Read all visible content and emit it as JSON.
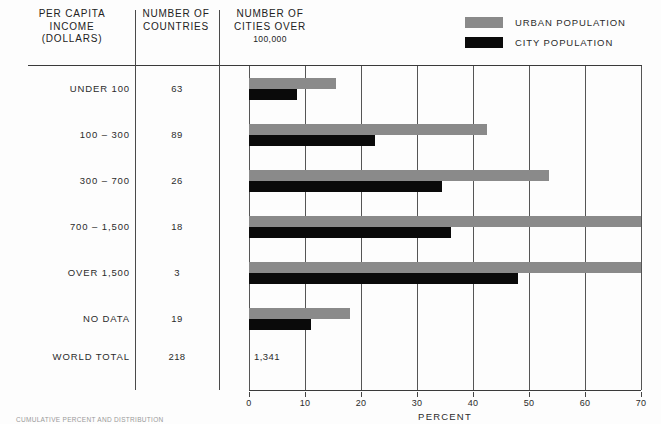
{
  "legend": {
    "items": [
      {
        "label": "URBAN POPULATION",
        "color": "#8a8a8a",
        "swatch": "urban-swatch"
      },
      {
        "label": "CITY POPULATION",
        "color": "#0a0a0a",
        "swatch": "city-swatch"
      }
    ]
  },
  "table": {
    "headers": {
      "income": {
        "line1": "PER CAPITA",
        "line2": "INCOME",
        "line3": "(DOLLARS)"
      },
      "countries": {
        "line1": "NUMBER OF",
        "line2": "COUNTRIES"
      },
      "cities": {
        "line1": "NUMBER OF",
        "line2": "CITIES OVER",
        "line3": "100,000"
      }
    },
    "rows": [
      {
        "label": "UNDER 100",
        "countries": "63",
        "cities": "186"
      },
      {
        "label": "100 – 300",
        "countries": "89",
        "cities": "303"
      },
      {
        "label": "300 – 700",
        "countries": "26",
        "cities": "309"
      },
      {
        "label": "700 – 1,500",
        "countries": "18",
        "cities": "194"
      },
      {
        "label": "OVER 1,500",
        "countries": "3",
        "cities": "171"
      },
      {
        "label": "NO DATA",
        "countries": "19",
        "cities": "178"
      }
    ],
    "total": {
      "label": "WORLD TOTAL",
      "countries": "218",
      "cities": "1,341"
    }
  },
  "footnote": "CUMULATIVE PERCENT AND DISTRIBUTION",
  "chart_data": {
    "type": "bar",
    "orientation": "horizontal",
    "title": "",
    "xlabel": "PERCENT",
    "ylabel": "",
    "xlim": [
      0,
      70
    ],
    "xticks": [
      0,
      10,
      20,
      30,
      40,
      50,
      60,
      70
    ],
    "xtick_labels": [
      "0",
      "10",
      "20",
      "30",
      "40",
      "50",
      "60",
      "70"
    ],
    "grid": "vertical",
    "legend_position": "top-right",
    "categories": [
      "UNDER 100",
      "100 – 300",
      "300 – 700",
      "700 – 1,500",
      "OVER 1,500",
      "NO DATA"
    ],
    "series": [
      {
        "name": "URBAN POPULATION",
        "color": "#8a8a8a",
        "values": [
          15.5,
          42.5,
          53.5,
          70.0,
          70.0,
          18.0
        ]
      },
      {
        "name": "CITY POPULATION",
        "color": "#0a0a0a",
        "values": [
          8.5,
          22.5,
          34.5,
          36.0,
          48.0,
          11.0
        ]
      }
    ]
  }
}
